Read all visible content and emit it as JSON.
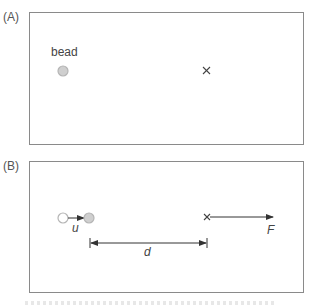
{
  "panels": {
    "a": {
      "label": "(A)",
      "bead_label": "bead",
      "target_marker": "×"
    },
    "b": {
      "label": "(B)",
      "velocity_label": "u",
      "distance_label": "d",
      "force_label": "F"
    }
  },
  "icons": {
    "bead": "filled-grey-circle",
    "initial_position": "open-circle",
    "target": "x-marker"
  },
  "colors": {
    "border": "#8a8a8a",
    "bead_fill": "#cfcfcf",
    "bead_stroke": "#b5b5b5",
    "line": "#444444"
  }
}
